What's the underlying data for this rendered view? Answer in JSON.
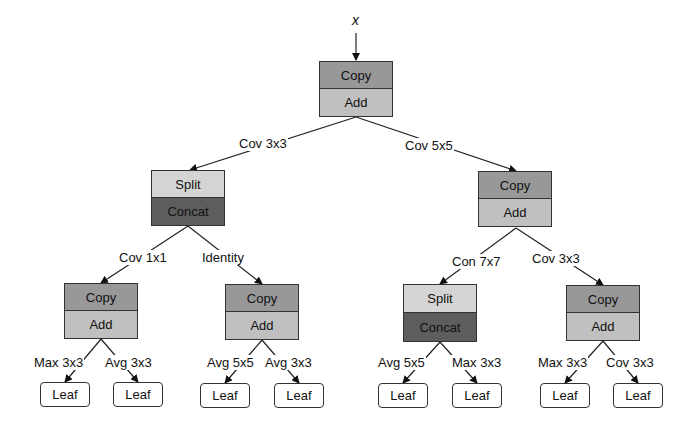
{
  "input": {
    "label": "x"
  },
  "nodes": {
    "root": {
      "top": "Copy",
      "bottom": "Add"
    },
    "l": {
      "top": "Split",
      "bottom": "Concat"
    },
    "r": {
      "top": "Copy",
      "bottom": "Add"
    },
    "ll": {
      "top": "Copy",
      "bottom": "Add"
    },
    "lr": {
      "top": "Copy",
      "bottom": "Add"
    },
    "rl": {
      "top": "Split",
      "bottom": "Concat"
    },
    "rr": {
      "top": "Copy",
      "bottom": "Add"
    }
  },
  "edges": {
    "root_l": "Cov 3x3",
    "root_r": "Cov 5x5",
    "l_ll": "Cov 1x1",
    "l_lr": "Identity",
    "r_rl": "Con 7x7",
    "r_rr": "Cov 3x3",
    "ll_1": "Max 3x3",
    "ll_2": "Avg 3x3",
    "lr_1": "Avg 5x5",
    "lr_2": "Avg 3x3",
    "rl_1": "Avg 5x5",
    "rl_2": "Max 3x3",
    "rr_1": "Max 3x3",
    "rr_2": "Cov 3x3"
  },
  "leaves": [
    "Leaf",
    "Leaf",
    "Leaf",
    "Leaf",
    "Leaf",
    "Leaf",
    "Leaf",
    "Leaf"
  ]
}
